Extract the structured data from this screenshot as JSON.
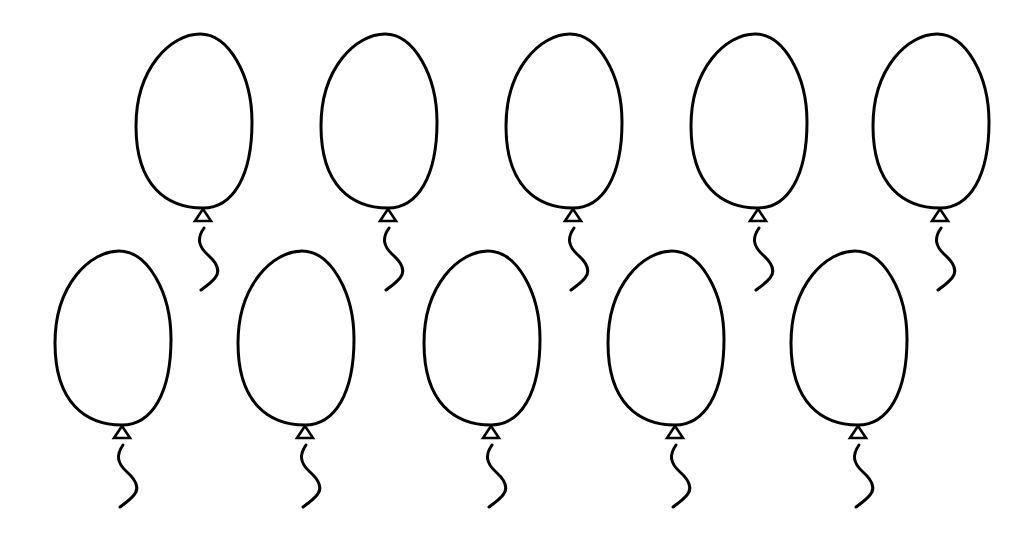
{
  "page": {
    "background_color": "#ffffff",
    "line_color": "#000000"
  },
  "rows": [
    {
      "name": "top-row",
      "balloons": [
        {
          "id": 1,
          "knot_x": 203,
          "knot_y": 208
        },
        {
          "id": 2,
          "knot_x": 388,
          "knot_y": 208
        },
        {
          "id": 3,
          "knot_x": 573,
          "knot_y": 208
        },
        {
          "id": 4,
          "knot_x": 758,
          "knot_y": 208
        },
        {
          "id": 5,
          "knot_x": 940,
          "knot_y": 208
        }
      ]
    },
    {
      "name": "bottom-row",
      "balloons": [
        {
          "id": 6,
          "knot_x": 122,
          "knot_y": 425
        },
        {
          "id": 7,
          "knot_x": 305,
          "knot_y": 425
        },
        {
          "id": 8,
          "knot_x": 491,
          "knot_y": 425
        },
        {
          "id": 9,
          "knot_x": 675,
          "knot_y": 425
        },
        {
          "id": 10,
          "knot_x": 858,
          "knot_y": 425
        }
      ]
    }
  ],
  "balloon_shape": {
    "body_path": "M0,0 C-36,0 -67,-22 -67,-82 C-67,-140 -32,-174 -3,-174 C26,-174 49,-132 49,-86 C49,-32 30,0 0,0 Z",
    "knot_points": "0,1 -8,13 8,13",
    "string_path": "M1,20 C-6,30 -5,38 5,47 C15,56 17,64 12,70 C8,75 2,79 -2,82"
  }
}
